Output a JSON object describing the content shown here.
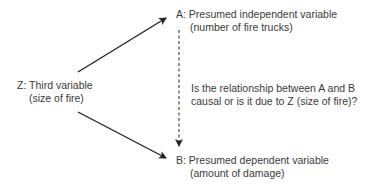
{
  "diagram": {
    "node_a": {
      "label": "A: Presumed independent variable",
      "sublabel": "(number of fire trucks)"
    },
    "node_z": {
      "label": "Z: Third variable",
      "sublabel": "(size of fire)"
    },
    "node_b": {
      "label": "B: Presumed dependent variable",
      "sublabel": "(amount of damage)"
    },
    "question": {
      "line1": "Is the relationship between A and B",
      "line2": "causal or is it due to Z (size of fire)?"
    },
    "edges": [
      {
        "from": "Z",
        "to": "A",
        "style": "solid"
      },
      {
        "from": "Z",
        "to": "B",
        "style": "solid"
      },
      {
        "from": "A",
        "to": "B",
        "style": "dashed"
      }
    ],
    "colors": {
      "text": "#3a3a3a",
      "arrow": "#222222",
      "background": "#ffffff"
    }
  }
}
